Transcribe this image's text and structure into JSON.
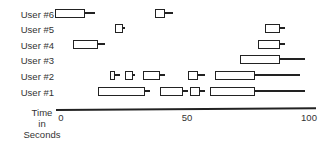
{
  "chart_data": {
    "type": "gantt",
    "title": "",
    "xlabel": "Time in Seconds",
    "ylabel": "",
    "xlim": [
      0,
      100
    ],
    "x_ticks": [
      "0",
      "50",
      "100"
    ],
    "categories": [
      "User #6",
      "User #5",
      "User #4",
      "User #3",
      "User #2",
      "User #1"
    ],
    "series": [
      {
        "name": "User #6",
        "segments": [
          {
            "box_start": -2,
            "box_end": 10,
            "tail_end": 14
          },
          {
            "box_start": 38,
            "box_end": 42,
            "tail_end": 45
          }
        ]
      },
      {
        "name": "User #5",
        "segments": [
          {
            "box_start": 22,
            "box_end": 25,
            "tail_end": 26
          },
          {
            "box_start": 82,
            "box_end": 88,
            "tail_end": 90
          }
        ]
      },
      {
        "name": "User #4",
        "segments": [
          {
            "box_start": 5,
            "box_end": 15,
            "tail_end": 18
          },
          {
            "box_start": 79,
            "box_end": 88,
            "tail_end": 90
          }
        ]
      },
      {
        "name": "User #3",
        "segments": [
          {
            "box_start": 72,
            "box_end": 88,
            "tail_end": 98
          }
        ]
      },
      {
        "name": "User #2",
        "segments": [
          {
            "box_start": 20,
            "box_end": 22,
            "tail_end": 24
          },
          {
            "box_start": 26,
            "box_end": 29,
            "tail_end": 30
          },
          {
            "box_start": 33,
            "box_end": 40,
            "tail_end": 42
          },
          {
            "box_start": 51,
            "box_end": 55,
            "tail_end": 58
          },
          {
            "box_start": 62,
            "box_end": 78,
            "tail_end": 96
          }
        ]
      },
      {
        "name": "User #1",
        "segments": [
          {
            "box_start": 15,
            "box_end": 34,
            "tail_end": 36
          },
          {
            "box_start": 40,
            "box_end": 49,
            "tail_end": 51
          },
          {
            "box_start": 52,
            "box_end": 56,
            "tail_end": 58
          },
          {
            "box_start": 60,
            "box_end": 78,
            "tail_end": 98
          }
        ]
      }
    ],
    "grid": false,
    "legend": "none"
  },
  "labels": {
    "users": [
      "User #6",
      "User #5",
      "User #4",
      "User #3",
      "User #2",
      "User #1"
    ],
    "x_axis_title": [
      "Time",
      "in",
      "Seconds"
    ],
    "ticks": [
      "0",
      "50",
      "100"
    ]
  }
}
